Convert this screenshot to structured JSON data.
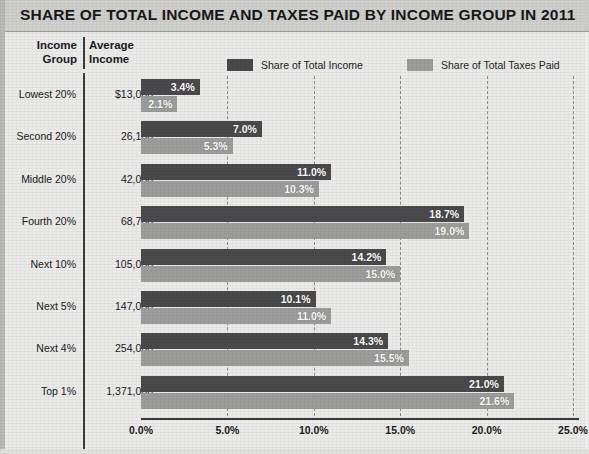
{
  "title": "SHARE OF TOTAL INCOME AND TAXES PAID BY INCOME GROUP IN 2011",
  "table": {
    "header": {
      "income_group_line1": "Income",
      "income_group_line2": "Group",
      "average_income_line1": "Average",
      "average_income_line2": "Income"
    }
  },
  "legend": {
    "income": {
      "label": "Share of Total Income",
      "color": "#4a4a4c"
    },
    "taxes": {
      "label": "Share of Total Taxes Paid",
      "color": "#9d9d9b"
    }
  },
  "colors": {
    "income_bar": "#4a4a4c",
    "taxes_bar": "#9d9d9b",
    "title_bar": "#cfcfcc",
    "plot_background": "#ebebe9",
    "axis": "#3b3b3d"
  },
  "chart_data": {
    "type": "bar",
    "orientation": "horizontal",
    "title": "SHARE OF TOTAL INCOME AND TAXES PAID BY INCOME GROUP IN 2011",
    "xlabel": "",
    "ylabel": "",
    "xlim": [
      0,
      25
    ],
    "xticks": [
      0,
      5,
      10,
      15,
      20,
      25
    ],
    "xtick_labels": [
      "0.0%",
      "5.0%",
      "10.0%",
      "15.0%",
      "20.0%",
      "25.0%"
    ],
    "grid": "vertical dashed at each x tick",
    "legend_position": "top",
    "categories": [
      "Lowest 20%",
      "Second 20%",
      "Middle 20%",
      "Fourth 20%",
      "Next 10%",
      "Next 5%",
      "Next 4%",
      "Top 1%"
    ],
    "average_income": [
      "$13,000",
      "26,100",
      "42,000",
      "68,700",
      "105,000",
      "147,000",
      "254,000",
      "1,371,000"
    ],
    "series": [
      {
        "name": "Share of Total Income",
        "color": "#4a4a4c",
        "values": [
          3.4,
          7.0,
          11.0,
          18.7,
          14.2,
          10.1,
          14.3,
          21.0
        ],
        "labels": [
          "3.4%",
          "7.0%",
          "11.0%",
          "18.7%",
          "14.2%",
          "10.1%",
          "14.3%",
          "21.0%"
        ]
      },
      {
        "name": "Share of Total Taxes Paid",
        "color": "#9d9d9b",
        "values": [
          2.1,
          5.3,
          10.3,
          19.0,
          15.0,
          11.0,
          15.5,
          21.6
        ],
        "labels": [
          "2.1%",
          "5.3%",
          "10.3%",
          "19.0%",
          "15.0%",
          "11.0%",
          "15.5%",
          "21.6%"
        ]
      }
    ]
  }
}
